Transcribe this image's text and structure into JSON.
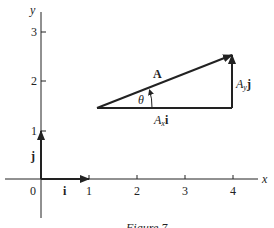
{
  "figure": {
    "caption": "Figure 7",
    "axes": {
      "x_label": "x",
      "y_label": "y",
      "x_ticks": [
        "0",
        "1",
        "2",
        "3",
        "4"
      ],
      "y_ticks": [
        "1",
        "2",
        "3"
      ]
    },
    "unit_vectors": {
      "i_label": "i",
      "j_label": "j"
    },
    "vector": {
      "name": "A",
      "angle_label": "θ",
      "x_component_prefix": "A",
      "x_component_sub": "x",
      "x_component_unit": "i",
      "y_component_prefix": "A",
      "y_component_sub": "y",
      "y_component_unit": "j"
    },
    "colors": {
      "ink": "#222222",
      "background": "#ffffff"
    }
  }
}
